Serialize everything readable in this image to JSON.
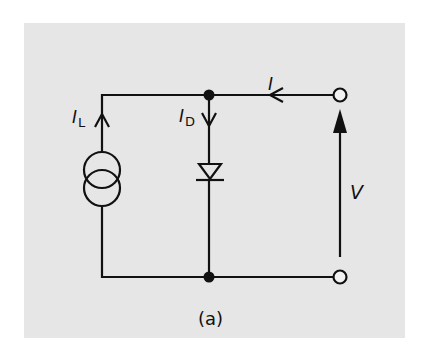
{
  "diagram": {
    "type": "circuit-schematic",
    "colors": {
      "background": "#e6e6e6",
      "page": "#ffffff",
      "stroke": "#111111"
    },
    "components": [
      {
        "name": "current-source",
        "label": "I",
        "subscript": "L",
        "direction": "up"
      },
      {
        "name": "diode",
        "label": "I",
        "subscript": "D",
        "direction": "down"
      },
      {
        "name": "terminal-top"
      },
      {
        "name": "terminal-bottom"
      }
    ],
    "labels": {
      "source_current_main": "I",
      "source_current_sub": "L",
      "diode_current_main": "I",
      "diode_current_sub": "D",
      "terminal_current": "I",
      "voltage": "V",
      "caption": "(a)"
    }
  }
}
